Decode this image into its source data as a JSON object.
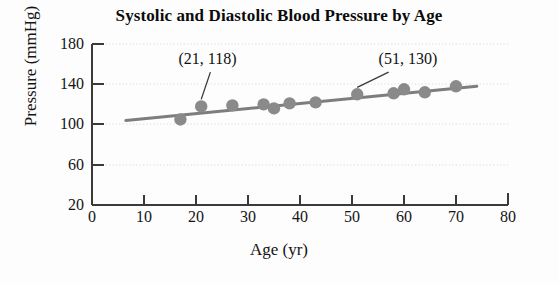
{
  "chart_data": {
    "type": "scatter",
    "title": "Systolic and Diastolic Blood Pressure by Age",
    "xlabel": "Age (yr)",
    "ylabel": "Pressure (mmHg)",
    "xlim": [
      0,
      80
    ],
    "ylim": [
      20,
      180
    ],
    "xticks": [
      0,
      10,
      20,
      30,
      40,
      50,
      60,
      70,
      80
    ],
    "yticks": [
      20,
      60,
      100,
      140,
      180
    ],
    "xtick_labels": [
      "0",
      "10",
      "20",
      "30",
      "40",
      "50",
      "60",
      "70",
      "80"
    ],
    "ytick_labels": [
      "20",
      "60",
      "100",
      "140",
      "180"
    ],
    "grid": "horizontal-dotted",
    "legend": "none",
    "marker_color": "#8a8a8a",
    "line_color": "#7d7d7d",
    "axis_color": "#3a3a3a",
    "grid_color": "#d8d8d8",
    "series": [
      {
        "name": "Systolic blood pressure",
        "points": [
          {
            "x": 17,
            "y": 105
          },
          {
            "x": 21,
            "y": 118
          },
          {
            "x": 27,
            "y": 119
          },
          {
            "x": 33,
            "y": 120
          },
          {
            "x": 35,
            "y": 116
          },
          {
            "x": 38,
            "y": 121
          },
          {
            "x": 43,
            "y": 122
          },
          {
            "x": 51,
            "y": 130
          },
          {
            "x": 58,
            "y": 131
          },
          {
            "x": 60,
            "y": 135
          },
          {
            "x": 64,
            "y": 132
          },
          {
            "x": 70,
            "y": 138
          }
        ]
      }
    ],
    "trendline": {
      "name": "linear-fit",
      "x_start": 6.5,
      "y_start": 104,
      "x_end": 74,
      "y_end": 138
    },
    "annotations": [
      {
        "label": "(21, 118)",
        "text_x": 17.0,
        "text_y": 163,
        "target_x": 21,
        "target_y": 118
      },
      {
        "label": "(51, 130)",
        "text_x": 55.5,
        "text_y": 163,
        "target_x": 51,
        "target_y": 130
      }
    ]
  },
  "figure": {
    "title": "Systolic and Diastolic Blood Pressure by Age",
    "x_axis_title": "Age (yr)",
    "y_axis_title": "Pressure (mmHg)",
    "annotation_1": "(21, 118)",
    "annotation_2": "(51, 130)",
    "ytick_0": "20",
    "ytick_1": "60",
    "ytick_2": "100",
    "ytick_3": "140",
    "ytick_4": "180",
    "xtick_0": "0",
    "xtick_1": "10",
    "xtick_2": "20",
    "xtick_3": "30",
    "xtick_4": "40",
    "xtick_5": "50",
    "xtick_6": "60",
    "xtick_7": "70",
    "xtick_8": "80"
  }
}
